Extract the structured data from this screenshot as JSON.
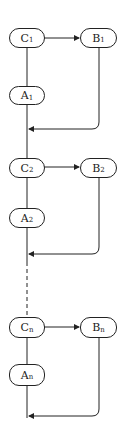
{
  "diagram": {
    "type": "flowchart",
    "stages": [
      {
        "c": {
          "base": "C",
          "sub": "1"
        },
        "b": {
          "base": "B",
          "sub": "1"
        },
        "a": {
          "base": "A",
          "sub": "1"
        }
      },
      {
        "c": {
          "base": "C",
          "sub": "2"
        },
        "b": {
          "base": "B",
          "sub": "2"
        },
        "a": {
          "base": "A",
          "sub": "2"
        }
      },
      {
        "c": {
          "base": "C",
          "sub": "n"
        },
        "b": {
          "base": "B",
          "sub": "n"
        },
        "a": {
          "base": "A",
          "sub": "n"
        }
      }
    ],
    "continuation": "dashed line between stage 2 and stage n",
    "colors": {
      "stroke": "#222222",
      "background": "#ffffff"
    }
  }
}
